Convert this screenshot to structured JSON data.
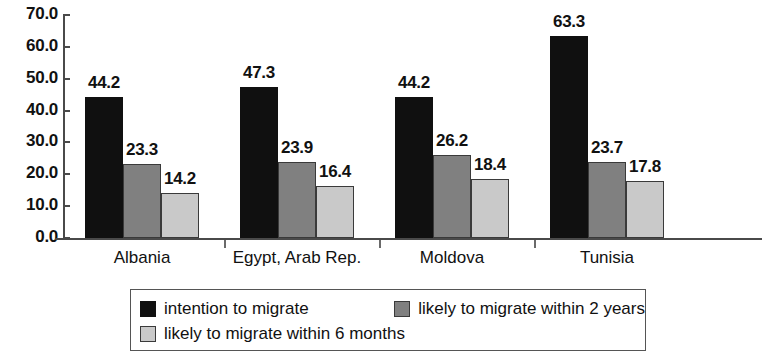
{
  "chart_data": {
    "type": "bar",
    "title": "",
    "subtitle": "",
    "xlabel": "",
    "ylabel": "",
    "ylim": [
      0,
      70
    ],
    "ytick_step": 10,
    "ytick_labels": [
      "0.0",
      "10.0",
      "20.0",
      "30.0",
      "40.0",
      "50.0",
      "60.0",
      "70.0"
    ],
    "ytick_values": [
      0,
      10,
      20,
      30,
      40,
      50,
      60,
      70
    ],
    "grid": false,
    "legend_position": "bottom",
    "value_label_format": "one-decimal",
    "categories": [
      "Albania",
      "Egypt, Arab Rep.",
      "Moldova",
      "Tunisia"
    ],
    "series": [
      {
        "name": "intention to migrate",
        "color": "#101010",
        "values": [
          44.2,
          47.3,
          44.2,
          63.3
        ],
        "labels": [
          "44.2",
          "47.3",
          "44.2",
          "63.3"
        ]
      },
      {
        "name": "likely to migrate within 2 years",
        "color": "#808080",
        "values": [
          23.3,
          23.9,
          26.2,
          23.7
        ],
        "labels": [
          "23.3",
          "23.9",
          "26.2",
          "23.7"
        ]
      },
      {
        "name": "likely to migrate within 6 months",
        "color": "#c9c9c9",
        "values": [
          14.2,
          16.4,
          18.4,
          17.8
        ],
        "labels": [
          "14.2",
          "16.4",
          "18.4",
          "17.8"
        ]
      }
    ]
  },
  "legend": {
    "items": [
      {
        "label": "intention to migrate",
        "swatch": "black-swatch"
      },
      {
        "label": "likely to migrate within 2 years",
        "swatch": "dark-gray-swatch"
      },
      {
        "label": "likely to migrate within 6 months",
        "swatch": "light-gray-swatch"
      }
    ]
  },
  "colors": {
    "series_1": "#101010",
    "series_2": "#808080",
    "series_3": "#c9c9c9",
    "axis": "#4a4a4a",
    "text": "#111111",
    "background": "#ffffff"
  }
}
